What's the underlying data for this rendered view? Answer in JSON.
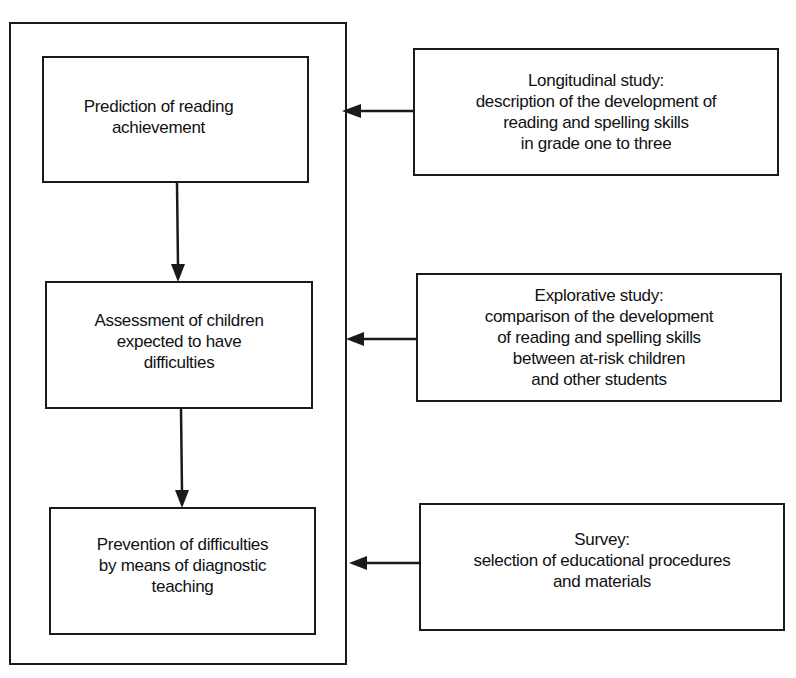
{
  "diagram": {
    "type": "flowchart",
    "main_column": {
      "boxes": [
        {
          "id": "prediction",
          "label": "Prediction of reading\nachievement"
        },
        {
          "id": "assessment",
          "label": "Assessment of children\nexpected to have\ndifficulties"
        },
        {
          "id": "prevention",
          "label": "Prevention of difficulties\nby means of diagnostic\nteaching"
        }
      ]
    },
    "side_studies": [
      {
        "id": "longitudinal",
        "label": "Longitudinal study:\ndescription of the development of\nreading and spelling skills\nin grade one to three",
        "feeds": "prediction"
      },
      {
        "id": "explorative",
        "label": "Explorative study:\ncomparison of the development\nof reading and spelling skills\nbetween at-risk children\nand other students",
        "feeds": "assessment"
      },
      {
        "id": "survey",
        "label": "Survey:\nselection of educational procedures\nand materials",
        "feeds": "prevention"
      }
    ],
    "edges": [
      {
        "from": "prediction",
        "to": "assessment",
        "direction": "down"
      },
      {
        "from": "assessment",
        "to": "prevention",
        "direction": "down"
      },
      {
        "from": "longitudinal",
        "to": "main_column",
        "direction": "left"
      },
      {
        "from": "explorative",
        "to": "main_column",
        "direction": "left"
      },
      {
        "from": "survey",
        "to": "main_column",
        "direction": "left"
      }
    ],
    "colors": {
      "stroke": "#1a1a1a",
      "background": "#ffffff",
      "text": "#111111"
    }
  }
}
